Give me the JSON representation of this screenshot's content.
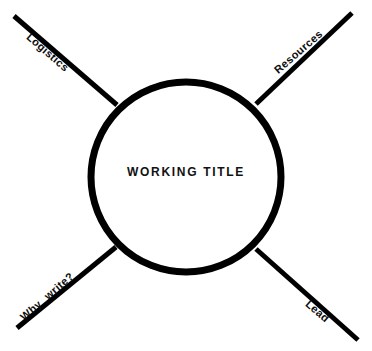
{
  "canvas": {
    "width": 372,
    "height": 351,
    "background_color": "#ffffff",
    "ink_color": "#000000"
  },
  "center_node": {
    "label": "WORKING TITLE",
    "shape": "circle",
    "center_x": 186,
    "center_y": 177,
    "radius": 97,
    "stroke_width": 7,
    "stroke_color": "#000000",
    "fill_color": "#ffffff"
  },
  "spokes": [
    {
      "id": "logistics",
      "label": "Logistics",
      "direction": "top-left",
      "angle_deg": 41,
      "x1": 14,
      "y1": 16,
      "x2": 117,
      "y2": 105,
      "stroke_width": 5
    },
    {
      "id": "resources",
      "label": "Resources",
      "direction": "top-right",
      "angle_deg": -41,
      "x1": 352,
      "y1": 13,
      "x2": 256,
      "y2": 104,
      "stroke_width": 5
    },
    {
      "id": "why-write",
      "label": "Why write?",
      "direction": "bottom-left",
      "angle_deg": -41,
      "x1": 17,
      "y1": 328,
      "x2": 116,
      "y2": 247,
      "stroke_width": 5
    },
    {
      "id": "lead",
      "label": "Lead",
      "direction": "bottom-right",
      "angle_deg": 41,
      "x1": 358,
      "y1": 340,
      "x2": 256,
      "y2": 249,
      "stroke_width": 5
    }
  ]
}
